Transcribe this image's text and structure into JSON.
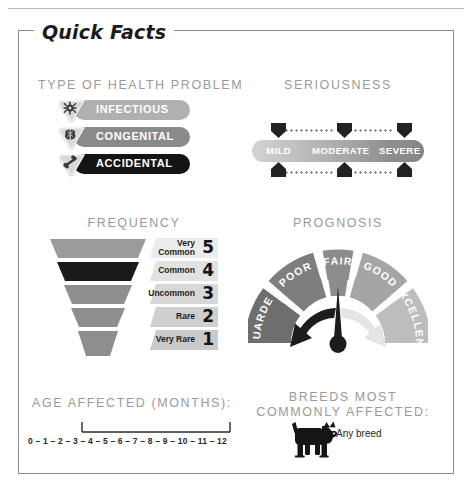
{
  "panel": {
    "title": "Quick Facts"
  },
  "health_problem": {
    "heading": "TYPE OF HEALTH PROBLEM",
    "items": [
      {
        "label": "INFECTIOUS",
        "icon": "germ-icon",
        "color": "#b0b0b0"
      },
      {
        "label": "CONGENITAL",
        "icon": "brain-icon",
        "color": "#8a8a8a"
      },
      {
        "label": "ACCIDENTAL",
        "icon": "bone-icon",
        "color": "#141414"
      }
    ]
  },
  "seriousness": {
    "heading": "SERIOUSNESS",
    "levels": [
      "MILD",
      "MODERATE",
      "SEVERE"
    ],
    "gradient_start": "#d3d3d3",
    "gradient_end": "#858585"
  },
  "frequency": {
    "heading": "FREQUENCY",
    "selected_rank": 4,
    "rows": [
      {
        "label": "Very Common",
        "rank": "5",
        "color": "#9b9b9b",
        "chip": "#ececec"
      },
      {
        "label": "Common",
        "rank": "4",
        "color": "#1a1a1a",
        "chip": "#e2e2e2"
      },
      {
        "label": "Uncommon",
        "rank": "3",
        "color": "#8e8e8e",
        "chip": "#d7d7d7"
      },
      {
        "label": "Rare",
        "rank": "2",
        "color": "#8e8e8e",
        "chip": "#cfcfcf"
      },
      {
        "label": "Very Rare",
        "rank": "1",
        "color": "#8e8e8e",
        "chip": "#c9c9c9"
      }
    ]
  },
  "prognosis": {
    "heading": "PROGNOSIS",
    "segments": [
      {
        "label": "GUARDED",
        "color": "#6e6e6e"
      },
      {
        "label": "POOR",
        "color": "#7e7e7e"
      },
      {
        "label": "FAIR",
        "color": "#8c8c8c"
      },
      {
        "label": "GOOD",
        "color": "#a5a5a5"
      },
      {
        "label": "EXCELLENT",
        "color": "#bdbdbd"
      }
    ],
    "needle_points_to": "FAIR",
    "arrow_left": "worse-arrow",
    "arrow_right": "better-arrow"
  },
  "age_affected": {
    "heading": "AGE AFFECTED (MONTHS):",
    "scale": "0 – 1 – 2 – 3 – 4 – 5 – 6 – 7 – 8 – 9 – 10 – 11 – 12",
    "range_start": 3,
    "range_end": 12
  },
  "breeds": {
    "heading_line1": "BREEDS MOST",
    "heading_line2": "COMMONLY AFFECTED:",
    "value": "Any breed",
    "icon": "dog-icon"
  }
}
